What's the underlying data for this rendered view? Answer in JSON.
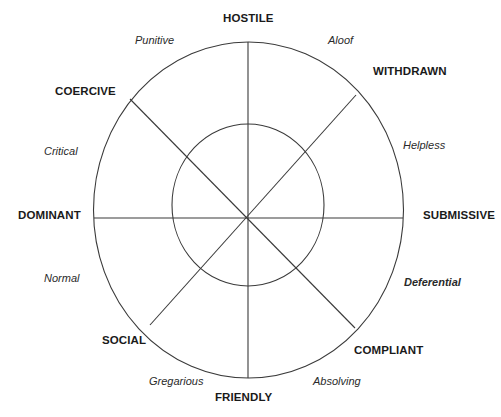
{
  "diagram": {
    "axis_labels": {
      "top": "HOSTILE",
      "upper_right": "WITHDRAWN",
      "right": "SUBMISSIVE",
      "lower_right": "COMPLIANT",
      "bottom": "FRIENDLY",
      "lower_left": "SOCIAL",
      "left": "DOMINANT",
      "upper_left": "COERCIVE"
    },
    "sector_labels": {
      "top_left": "Punitive",
      "top_right": "Aloof",
      "right_upper": "Helpless",
      "right_lower": "Deferential",
      "bottom_right": "Absolving",
      "bottom_left": "Gregarious",
      "left_lower": "Normal",
      "left_upper": "Critical"
    },
    "emphasized_sector": "Deferential",
    "line_color": "#3a3a3a"
  }
}
